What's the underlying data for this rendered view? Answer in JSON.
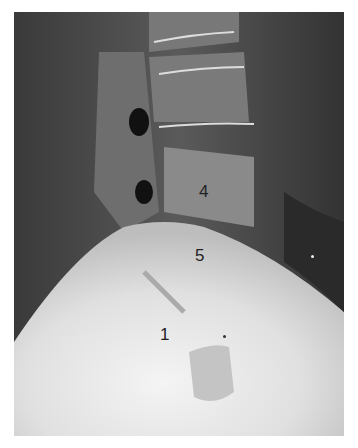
{
  "image": {
    "description": "Lateral lumbosacral spine radiograph",
    "labels": [
      {
        "id": "vertebra-4",
        "text": "4"
      },
      {
        "id": "vertebra-5",
        "text": "5"
      },
      {
        "id": "sacral-1",
        "text": "1"
      }
    ],
    "markers": [
      {
        "id": "asterisk-marker",
        "text": "*"
      }
    ]
  }
}
